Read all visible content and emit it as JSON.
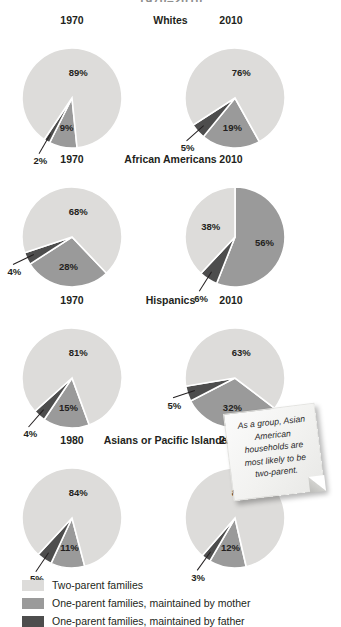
{
  "chart_title": "1970–2010",
  "note": {
    "text": "As a group, Asian American households are most likely to be two-parent."
  },
  "legend": {
    "items": [
      {
        "label": "Two-parent families",
        "color": "#dddcda",
        "key": "two_parent"
      },
      {
        "label": "One-parent families, maintained by mother",
        "color": "#9a9a9a",
        "key": "mother"
      },
      {
        "label": "One-parent families, maintained by father",
        "color": "#4d4d4d",
        "key": "father"
      }
    ]
  },
  "chart_data": {
    "type": "pie",
    "title": "1970–2010",
    "legend_position": "bottom",
    "series_names": [
      "Two-parent families",
      "One-parent families, maintained by mother",
      "One-parent families, maintained by father"
    ],
    "colors": [
      "#dddcda",
      "#9a9a9a",
      "#4d4d4d"
    ],
    "groups": [
      {
        "group": "Whites",
        "charts": [
          {
            "year": "1970",
            "values": {
              "two_parent": 89,
              "mother": 9,
              "father": 2
            },
            "labels": {
              "two_parent": "89%",
              "mother": "9%",
              "father": "2%"
            }
          },
          {
            "year": "2010",
            "values": {
              "two_parent": 76,
              "mother": 19,
              "father": 5
            },
            "labels": {
              "two_parent": "76%",
              "mother": "19%",
              "father": "5%"
            }
          }
        ]
      },
      {
        "group": "African Americans",
        "charts": [
          {
            "year": "1970",
            "values": {
              "two_parent": 68,
              "mother": 28,
              "father": 4
            },
            "labels": {
              "two_parent": "68%",
              "mother": "28%",
              "father": "4%"
            }
          },
          {
            "year": "2010",
            "values": {
              "two_parent": 38,
              "mother": 56,
              "father": 6
            },
            "labels": {
              "two_parent": "38%",
              "mother": "56%",
              "father": "6%"
            }
          }
        ]
      },
      {
        "group": "Hispanics",
        "charts": [
          {
            "year": "1970",
            "values": {
              "two_parent": 81,
              "mother": 15,
              "father": 4
            },
            "labels": {
              "two_parent": "81%",
              "mother": "15%",
              "father": "4%"
            }
          },
          {
            "year": "2010",
            "values": {
              "two_parent": 63,
              "mother": 32,
              "father": 5
            },
            "labels": {
              "two_parent": "63%",
              "mother": "32%",
              "father": "5%"
            }
          }
        ]
      },
      {
        "group": "Asians or Pacific Islanders",
        "charts": [
          {
            "year": "1980",
            "values": {
              "two_parent": 84,
              "mother": 11,
              "father": 5
            },
            "labels": {
              "two_parent": "84%",
              "mother": "11%",
              "father": "5%"
            }
          },
          {
            "year": "2010",
            "values": {
              "two_parent": 85,
              "mother": 12,
              "father": 3
            },
            "labels": {
              "two_parent": "85%",
              "mother": "12%",
              "father": "3%"
            }
          }
        ]
      }
    ]
  }
}
